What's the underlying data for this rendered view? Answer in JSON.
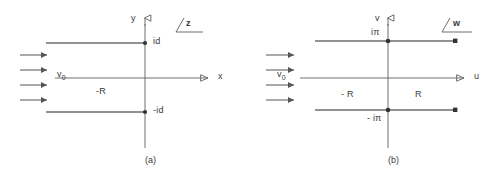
{
  "figure": {
    "stroke_color": "#6e6e6e",
    "text_color": "#3a3a3a",
    "background": "#ffffff"
  },
  "panels": [
    {
      "id": "a",
      "caption": "(a)",
      "plane_tag": "z",
      "axes": {
        "vertical_label": "y",
        "horizontal_label": "x",
        "vertical_arrow": "open-triangle-up",
        "horizontal_arrow": "open-triangle-right"
      },
      "inflow": {
        "label": "v",
        "label_subscript": "0",
        "arrow_count": 4,
        "arrow_head": "solid"
      },
      "annotations": [
        {
          "name": "branch-point-upper",
          "text": "id"
        },
        {
          "name": "branch-point-lower",
          "text": "-id"
        },
        {
          "name": "region-left",
          "text": "-R"
        }
      ]
    },
    {
      "id": "b",
      "caption": "(b)",
      "plane_tag": "w",
      "axes": {
        "vertical_label": "v",
        "horizontal_label": "u",
        "vertical_arrow": "open-triangle-up",
        "horizontal_arrow": "open-triangle-right"
      },
      "inflow": {
        "label": "v",
        "label_subscript": "0",
        "arrow_count": 4,
        "arrow_head": "solid"
      },
      "annotations": [
        {
          "name": "branch-point-upper",
          "text": "iπ"
        },
        {
          "name": "branch-point-lower",
          "text": "- iπ"
        },
        {
          "name": "region-left",
          "text": "- R"
        },
        {
          "name": "region-right",
          "text": "R"
        }
      ]
    }
  ]
}
